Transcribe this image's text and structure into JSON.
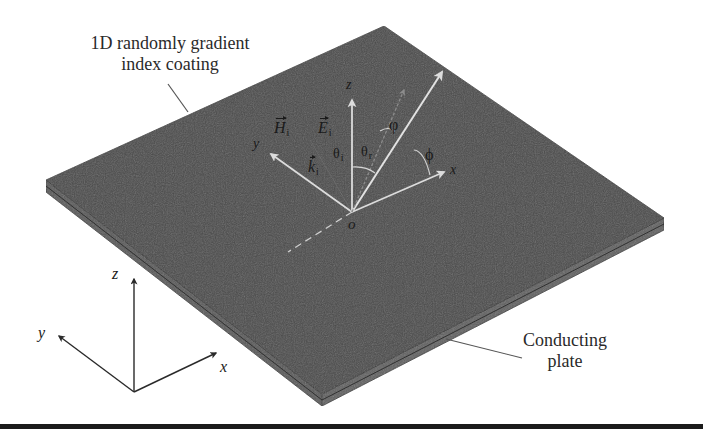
{
  "figure": {
    "labels": {
      "coating_line1": "1D randomly gradient",
      "coating_line2": "index coating",
      "plate_line1": "Conducting",
      "plate_line2": "plate"
    },
    "plate_axes": {
      "z": "z",
      "y": "y",
      "x": "x",
      "origin": "o"
    },
    "field_vectors": {
      "H": "H",
      "H_sub": "i",
      "E": "E",
      "E_sub": "i",
      "k": "k",
      "k_sub": "i"
    },
    "angles": {
      "theta_i": "θ",
      "theta_i_sub": "i",
      "theta_r": "θ",
      "theta_r_sub": "r",
      "varphi": "φ",
      "phi": "ϕ"
    },
    "reference_axes": {
      "z": "z",
      "y": "y",
      "x": "x"
    },
    "colors": {
      "plate_top": "#4a4a4a",
      "plate_edge": "#5a5a5a",
      "plate_outline": "#2e2e2e",
      "arrow_light": "#d8d8d8",
      "arrow_dim": "#8a8a8a",
      "ink": "#1a1a1a",
      "background": "#ffffff"
    }
  }
}
